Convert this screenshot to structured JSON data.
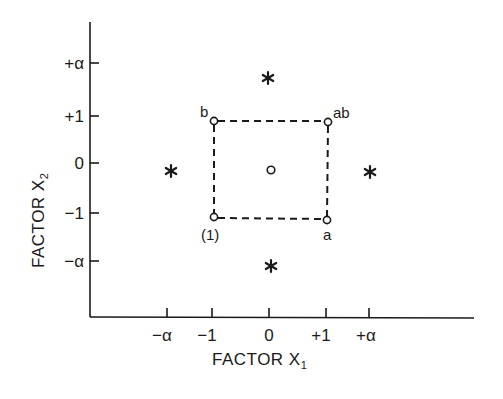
{
  "diagram": {
    "type": "central-composite-design",
    "x_axis": {
      "title": "FACTOR X",
      "title_subscript": "1",
      "ticks": [
        {
          "label": "−α",
          "value": "-alpha"
        },
        {
          "label": "−1",
          "value": -1
        },
        {
          "label": "0",
          "value": 0
        },
        {
          "label": "+1",
          "value": 1
        },
        {
          "label": "+α",
          "value": "+alpha"
        }
      ]
    },
    "y_axis": {
      "title": "FACTOR X",
      "title_subscript": "2",
      "ticks": [
        {
          "label": "+α",
          "value": "+alpha"
        },
        {
          "label": "+1",
          "value": 1
        },
        {
          "label": "0",
          "value": 0
        },
        {
          "label": "−1",
          "value": -1
        },
        {
          "label": "−α",
          "value": "-alpha"
        }
      ]
    },
    "factorial_points": [
      {
        "label": "(1)",
        "x": -1,
        "y": -1,
        "marker": "open-circle"
      },
      {
        "label": "a",
        "x": 1,
        "y": -1,
        "marker": "open-circle"
      },
      {
        "label": "b",
        "x": -1,
        "y": 1,
        "marker": "open-circle"
      },
      {
        "label": "ab",
        "x": 1,
        "y": 1,
        "marker": "open-circle"
      }
    ],
    "center_point": {
      "label": "",
      "x": 0,
      "y": 0,
      "marker": "open-circle"
    },
    "axial_points": [
      {
        "x": 0,
        "y": "+alpha",
        "marker": "asterisk"
      },
      {
        "x": "-alpha",
        "y": 0,
        "marker": "asterisk"
      },
      {
        "x": "+alpha",
        "y": 0,
        "marker": "asterisk"
      },
      {
        "x": 0,
        "y": "-alpha",
        "marker": "asterisk"
      }
    ],
    "square_style": "dashed",
    "colors": {
      "ink": "#1a1a1a",
      "background": "#ffffff"
    }
  }
}
